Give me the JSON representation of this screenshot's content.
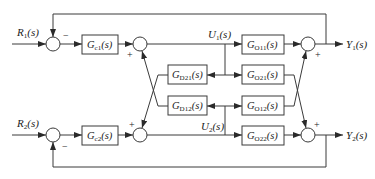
{
  "diagram": {
    "inputs": [
      {
        "id": "R1",
        "label": "R",
        "sub": "1",
        "arg": "(s)"
      },
      {
        "id": "R2",
        "label": "R",
        "sub": "2",
        "arg": "(s)"
      }
    ],
    "outputs": [
      {
        "id": "Y1",
        "label": "Y",
        "sub": "1",
        "arg": "(s)"
      },
      {
        "id": "Y2",
        "label": "Y",
        "sub": "2",
        "arg": "(s)"
      }
    ],
    "signals": [
      {
        "id": "U1",
        "label": "U",
        "sub": "1",
        "arg": "(s)"
      },
      {
        "id": "U2",
        "label": "U",
        "sub": "2",
        "arg": "(s)"
      }
    ],
    "blocks": {
      "Gc1": {
        "label": "G",
        "sub": "c1",
        "arg": "(s)"
      },
      "Gc2": {
        "label": "G",
        "sub": "c2",
        "arg": "(s)"
      },
      "Gd21": {
        "label": "G",
        "sub": "D21",
        "arg": "(s)"
      },
      "Gd12": {
        "label": "G",
        "sub": "D12",
        "arg": "(s)"
      },
      "Go11": {
        "label": "G",
        "sub": "O11",
        "arg": "(s)"
      },
      "Go21": {
        "label": "G",
        "sub": "O21",
        "arg": "(s)"
      },
      "Go12": {
        "label": "G",
        "sub": "O12",
        "arg": "(s)"
      },
      "Go22": {
        "label": "G",
        "sub": "O22",
        "arg": "(s)"
      }
    },
    "signs": {
      "error1_feedback": "−",
      "error2_feedback": "−",
      "decouple1_cross": "+",
      "decouple2_cross": "+",
      "output1_cross": "+",
      "output2_cross": "+"
    },
    "colors": {
      "line": "#3a3a3a",
      "text": "#222222",
      "background": "#ffffff"
    }
  }
}
